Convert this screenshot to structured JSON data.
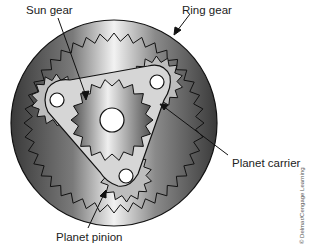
{
  "diagram": {
    "labels": {
      "sun_gear": "Sun gear",
      "ring_gear": "Ring gear",
      "planet_carrier": "Planet carrier",
      "planet_pinion": "Planet pinion"
    },
    "credit": "© Delmar/Cengage Learning",
    "colors": {
      "ring_dark": "#3a3a3a",
      "ring_light": "#e8e8e8",
      "carrier": "#d6d6d6",
      "outline": "#111111",
      "background": "#ffffff"
    }
  }
}
